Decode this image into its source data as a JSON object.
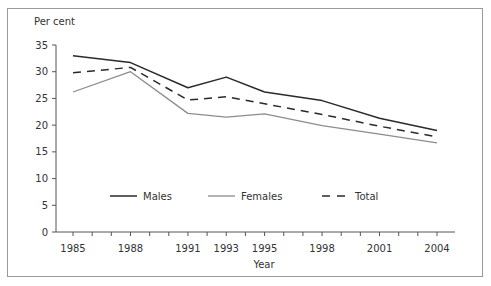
{
  "chart_data": {
    "type": "line",
    "title": "",
    "ylabel": "Per cent",
    "xlabel": "Year",
    "ylim": [
      0,
      35
    ],
    "yticks": [
      0,
      5,
      10,
      15,
      20,
      25,
      30,
      35
    ],
    "xrange": [
      1985,
      2004
    ],
    "xtick_labels": [
      "1985",
      "1988",
      "1991",
      "1993",
      "1995",
      "1998",
      "2001",
      "2004"
    ],
    "minor_xticks_every_year": true,
    "grid": false,
    "legend_position": "inside-bottom",
    "x": [
      1985,
      1988,
      1991,
      1993,
      1995,
      1998,
      2001,
      2004
    ],
    "series": [
      {
        "name": "Males",
        "style": "solid",
        "color": "#2a2a2a",
        "values": [
          33.0,
          31.7,
          27.0,
          29.0,
          26.2,
          24.6,
          21.3,
          19.0
        ]
      },
      {
        "name": "Females",
        "style": "solid",
        "color": "#8c8c8c",
        "values": [
          26.2,
          30.0,
          22.2,
          21.5,
          22.1,
          19.9,
          18.3,
          16.7
        ]
      },
      {
        "name": "Total",
        "style": "dashed",
        "color": "#2a2a2a",
        "values": [
          29.8,
          30.8,
          24.7,
          25.3,
          24.0,
          22.0,
          19.8,
          17.8
        ]
      }
    ]
  },
  "labels": {
    "ylabel": "Per cent",
    "xlabel": "Year",
    "legend": [
      "Males",
      "Females",
      "Total"
    ]
  }
}
